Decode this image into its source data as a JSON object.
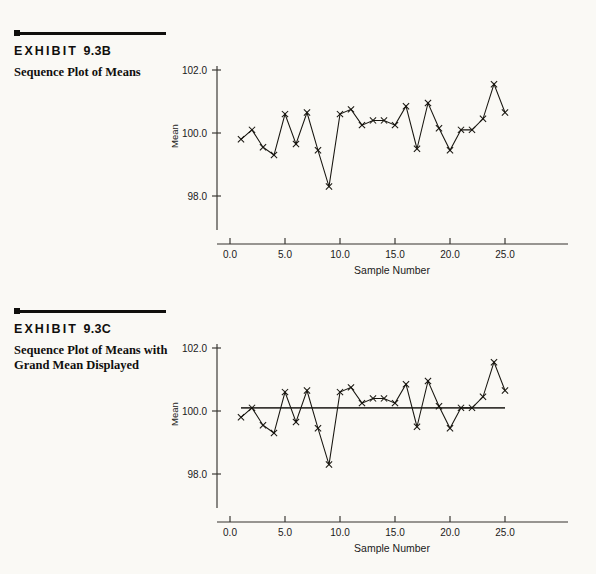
{
  "page": {
    "background_color": "#faf9f5",
    "ink_color": "#100f0d"
  },
  "exhibits": [
    {
      "id": "exhibit-b",
      "title_word": "EXHIBIT",
      "title_number": "9.3B",
      "caption": "Sequence Plot of Means"
    },
    {
      "id": "exhibit-c",
      "title_word": "EXHIBIT",
      "title_number": "9.3C",
      "caption": "Sequence Plot of Means with Grand Mean Displayed"
    }
  ],
  "chart_data": [
    {
      "id": "chart-b",
      "type": "line",
      "title": "Sequence Plot of Means",
      "xlabel": "Sample  Number",
      "ylabel": "Mean",
      "xlim": [
        0.0,
        27.5
      ],
      "ylim": [
        97.1,
        102.3
      ],
      "xticks": [
        0.0,
        5.0,
        10.0,
        15.0,
        20.0,
        25.0
      ],
      "xticklabels": [
        "0.0",
        "5.0",
        "10.0",
        "15.0",
        "20.0",
        "25.0"
      ],
      "yticks": [
        98.0,
        100.0,
        102.0
      ],
      "yticklabels": [
        "98.0",
        "100.0",
        "102.0"
      ],
      "grid": false,
      "legend": "none",
      "marker": "x",
      "x": [
        1,
        2,
        3,
        4,
        5,
        6,
        7,
        8,
        9,
        10,
        11,
        12,
        13,
        14,
        15,
        16,
        17,
        18,
        19,
        20,
        21,
        22,
        23,
        24,
        25
      ],
      "values": [
        99.8,
        100.1,
        99.55,
        99.3,
        100.6,
        99.65,
        100.65,
        99.45,
        98.3,
        100.6,
        100.75,
        100.25,
        100.4,
        100.4,
        100.25,
        100.85,
        99.5,
        100.95,
        100.15,
        99.45,
        100.1,
        100.1,
        100.45,
        101.55,
        100.65
      ]
    },
    {
      "id": "chart-c",
      "type": "line",
      "title": "Sequence Plot of Means with Grand Mean Displayed",
      "xlabel": "Sample  Number",
      "ylabel": "Mean",
      "xlim": [
        0.0,
        27.5
      ],
      "ylim": [
        97.1,
        102.3
      ],
      "xticks": [
        0.0,
        5.0,
        10.0,
        15.0,
        20.0,
        25.0
      ],
      "xticklabels": [
        "0.0",
        "5.0",
        "10.0",
        "15.0",
        "20.0",
        "25.0"
      ],
      "yticks": [
        98.0,
        100.0,
        102.0
      ],
      "yticklabels": [
        "98.0",
        "100.0",
        "102.0"
      ],
      "grid": false,
      "legend": "none",
      "marker": "x",
      "x": [
        1,
        2,
        3,
        4,
        5,
        6,
        7,
        8,
        9,
        10,
        11,
        12,
        13,
        14,
        15,
        16,
        17,
        18,
        19,
        20,
        21,
        22,
        23,
        24,
        25
      ],
      "values": [
        99.8,
        100.1,
        99.55,
        99.3,
        100.6,
        99.65,
        100.65,
        99.45,
        98.3,
        100.6,
        100.75,
        100.25,
        100.4,
        100.4,
        100.25,
        100.85,
        99.5,
        100.95,
        100.15,
        99.45,
        100.1,
        100.1,
        100.45,
        101.55,
        100.65
      ],
      "reference_line": {
        "label": "Grand Mean",
        "value": 100.1,
        "color": "#3a3834"
      }
    }
  ]
}
